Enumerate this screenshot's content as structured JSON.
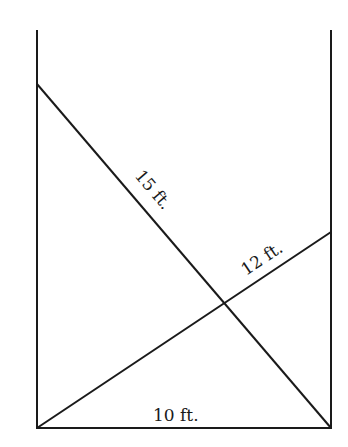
{
  "diagram": {
    "type": "crossed-ladders",
    "walls": {
      "left_x": 37,
      "right_x": 331,
      "top_y": 30,
      "floor_y": 428
    },
    "ladders": [
      {
        "name": "ladder-15",
        "label": "15 ft.",
        "from": [
          37,
          84
        ],
        "to": [
          331,
          428
        ]
      },
      {
        "name": "ladder-12",
        "label": "12 ft.",
        "from": [
          37,
          428
        ],
        "to": [
          331,
          232
        ]
      }
    ],
    "floor_label": "10 ft.",
    "line_color": "#1a1a1a"
  }
}
